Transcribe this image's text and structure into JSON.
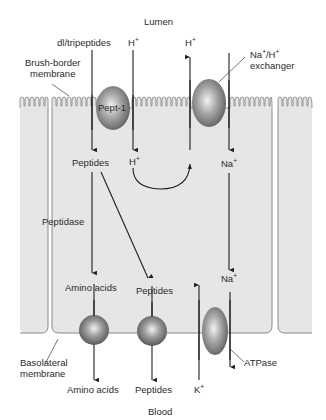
{
  "diagram": {
    "title_top": "Lumen",
    "title_bottom": "Blood",
    "colors": {
      "cell_fill": "#e6e6e6",
      "cell_outline": "#8a8a8a",
      "arrow": "#1e1e1e",
      "transporter": "#8c8c8c",
      "background": "#ffffff"
    },
    "labels": {
      "di_tripeptides": "dl/tripeptides",
      "h_plus_in_pept1": "H",
      "h_plus_out": "H",
      "na_h_exchanger_line1": "Na",
      "na_h_exchanger_sep": "/H",
      "na_h_exchanger_line2": "exchanger",
      "brush_border_line1": "Brush-border",
      "brush_border_line2": "membrane",
      "pept1": "Pept-1",
      "peptides_cell": "Peptides",
      "h_plus_cell": "H",
      "na_plus_cell": "Na",
      "peptidase": "Peptidase",
      "amino_acids_cell": "Amino acids",
      "peptides_basal": "Peptides",
      "na_plus_basal": "Na",
      "basolateral_line1": "Basolateral",
      "basolateral_line2": "membrane",
      "atpase": "ATPase",
      "amino_acids_blood": "Amino acids",
      "peptides_blood": "Peptides",
      "k_plus": "K",
      "plus": "+"
    },
    "transporters": [
      {
        "name": "Pept-1",
        "shape": "oval"
      },
      {
        "name": "Na+/H+ exchanger",
        "shape": "oval"
      },
      {
        "name": "Amino acid transporter",
        "shape": "sphere"
      },
      {
        "name": "Peptide transporter",
        "shape": "sphere"
      },
      {
        "name": "ATPase",
        "shape": "oval"
      }
    ]
  }
}
